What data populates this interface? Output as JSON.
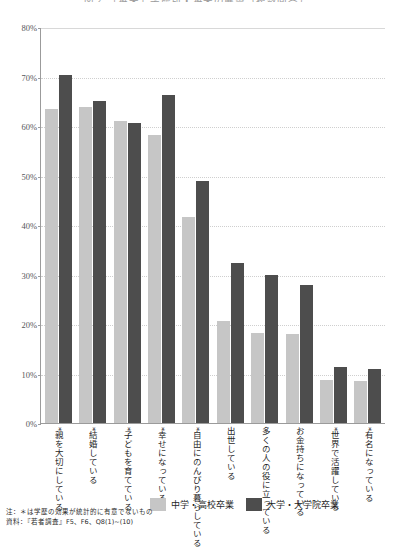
{
  "chart_data": {
    "type": "bar",
    "title": "図２ 「将来」学歴別・将来の展望（複数回答）",
    "xlabel": "",
    "ylabel": "",
    "ylim": [
      0,
      80
    ],
    "ytick_labels": [
      "80%",
      "70%",
      "60%",
      "50%",
      "40%",
      "30%",
      "20%",
      "10%",
      "0%"
    ],
    "ytick_values": [
      80,
      70,
      60,
      50,
      40,
      30,
      20,
      10,
      0
    ],
    "grid": true,
    "legend_position": "bottom",
    "categories": [
      "*親を大切にしている",
      "*結婚している",
      "*子どもを育てている",
      "*幸せになっている",
      "*自由にのんびり暮らしている",
      "出世している",
      "多くの人の役に立っている",
      "お金持ちになっている",
      "*世界で活躍している",
      "*有名になっている"
    ],
    "series": [
      {
        "name": "中学・高校卒業",
        "color": "#c6c6c6",
        "values": [
          63.5,
          63.8,
          61.0,
          58.2,
          41.7,
          20.7,
          18.2,
          18.0,
          8.6,
          8.4
        ]
      },
      {
        "name": "大学・大学院卒業",
        "color": "#4d4d4d",
        "values": [
          70.3,
          65.0,
          60.6,
          66.3,
          48.8,
          32.3,
          30.0,
          27.8,
          11.3,
          10.9
        ]
      }
    ]
  },
  "footnotes": {
    "note": "注：＊は学歴の効果が統計的に有意でないもの",
    "source": "資料：『若者調査』F5、F6、Q8(1)~(10)"
  }
}
